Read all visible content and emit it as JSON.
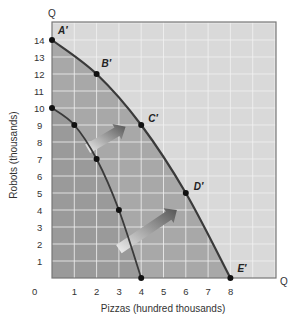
{
  "chart_data": {
    "type": "line",
    "title": "",
    "xlabel": "Pizzas (hundred thousands)",
    "ylabel": "Robots (thousands)",
    "x_axis_end_label": "Q",
    "y_axis_end_label": "Q",
    "xlim": [
      0,
      10
    ],
    "ylim": [
      0,
      15
    ],
    "x_ticks": [
      "0",
      "1",
      "2",
      "3",
      "4",
      "5",
      "6",
      "7",
      "8"
    ],
    "y_ticks": [
      "1",
      "2",
      "3",
      "4",
      "5",
      "6",
      "7",
      "8",
      "9",
      "10",
      "11",
      "12",
      "13",
      "14"
    ],
    "grid": true,
    "series": [
      {
        "name": "Original PPF",
        "points": [
          {
            "x": 0,
            "y": 10
          },
          {
            "x": 1,
            "y": 9
          },
          {
            "x": 2,
            "y": 7
          },
          {
            "x": 3,
            "y": 4
          },
          {
            "x": 4,
            "y": 0
          }
        ]
      },
      {
        "name": "New PPF",
        "points": [
          {
            "x": 0,
            "y": 14,
            "label": "A′"
          },
          {
            "x": 2,
            "y": 12,
            "label": "B′"
          },
          {
            "x": 4,
            "y": 9,
            "label": "C′"
          },
          {
            "x": 6,
            "y": 5,
            "label": "D′"
          },
          {
            "x": 8,
            "y": 0,
            "label": "E′"
          }
        ]
      }
    ],
    "annotations": [
      {
        "type": "arrow",
        "description": "Outward shift arrow",
        "from": {
          "x": 1.6,
          "y": 7.6
        },
        "to": {
          "x": 3.3,
          "y": 8.9
        }
      },
      {
        "type": "arrow",
        "description": "Outward shift arrow",
        "from": {
          "x": 3.0,
          "y": 1.7
        },
        "to": {
          "x": 5.6,
          "y": 4.0
        }
      }
    ],
    "colors": {
      "outer_region": "#a8a8a8",
      "inner_region": "#9a9a9a",
      "background": "#d9d9d9",
      "grid": "#f2f2f2",
      "curve": "#3a3a3a"
    }
  }
}
